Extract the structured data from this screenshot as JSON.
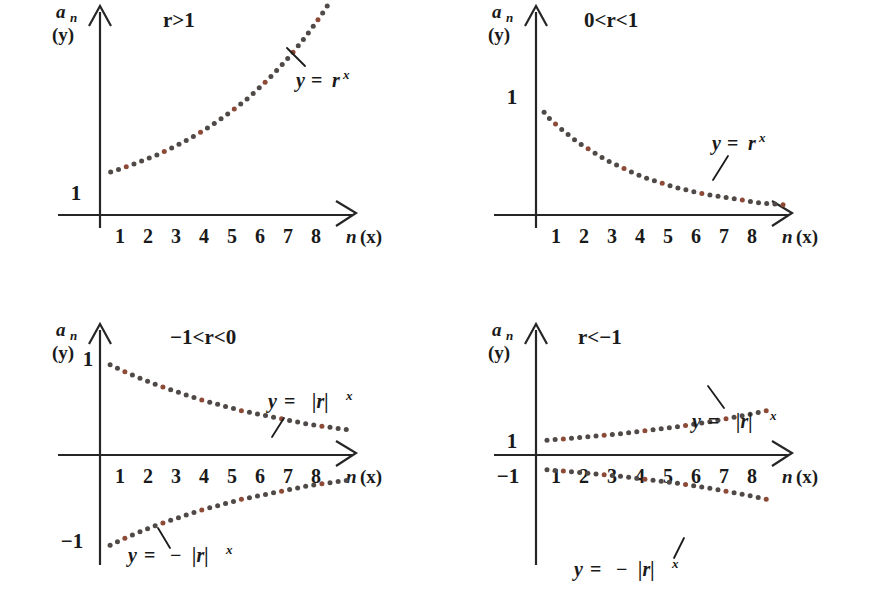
{
  "figure": {
    "background_color": "#ffffff",
    "axis_color": "#262626",
    "dot_color_dark": "#4f4a47",
    "dot_color_red": "#8d4a37"
  },
  "common": {
    "y_axis_label_main": "a",
    "y_axis_label_sub": "n",
    "y_axis_label_alt": "(y)",
    "x_axis_label_main": "n",
    "x_axis_label_alt": "(x)",
    "x_ticks": [
      "1",
      "2",
      "3",
      "4",
      "5",
      "6",
      "7",
      "8"
    ]
  },
  "panels": [
    {
      "id": "top-left",
      "title": "r>1",
      "y_ticks": [
        "1"
      ],
      "curves": [
        {
          "label_y": "y",
          "label_eq": "=",
          "label_base": "r",
          "label_exp": "x",
          "label_full": "y = rˣ",
          "label_plain": "y = r^x"
        }
      ]
    },
    {
      "id": "top-right",
      "title": "0<r<1",
      "y_ticks": [
        "1"
      ],
      "curves": [
        {
          "label_y": "y",
          "label_eq": "=",
          "label_base": "r",
          "label_exp": "x",
          "label_full": "y = rˣ",
          "label_plain": "y = r^x"
        }
      ]
    },
    {
      "id": "bottom-left",
      "title": "−1<r<0",
      "y_ticks": [
        "1",
        "−1"
      ],
      "curves": [
        {
          "label_y": "y",
          "label_eq": "=",
          "label_base": "|r|",
          "label_exp": "x",
          "label_plain": "y = |r|^x"
        },
        {
          "label_y": "y",
          "label_eq": "=",
          "label_minus": "−",
          "label_base": "|r|",
          "label_exp": "x",
          "label_plain": "y = -|r|^x"
        }
      ]
    },
    {
      "id": "bottom-right",
      "title": "r<−1",
      "y_ticks": [
        "1",
        "−1"
      ],
      "curves": [
        {
          "label_y": "y",
          "label_eq": "=",
          "label_base": "|r|",
          "label_exp": "x",
          "label_plain": "y = |r|^x"
        },
        {
          "label_y": "y",
          "label_eq": "=",
          "label_minus": "−",
          "label_base": "|r|",
          "label_exp": "x",
          "label_plain": "y = -|r|^x"
        }
      ]
    }
  ],
  "chart_data": {
    "type": "scatter",
    "xlabel": "n (x)",
    "ylabel": "a_n (y)",
    "grid": false,
    "legend": "inline-annotations",
    "charts": [
      {
        "panel": "top-left",
        "condition": "r>1",
        "xlim": [
          0,
          9.2
        ],
        "ylim": [
          0,
          5.2
        ],
        "x_ticks": [
          1,
          2,
          3,
          4,
          5,
          6,
          7,
          8
        ],
        "y_ticks": [
          1
        ],
        "series": [
          {
            "name": "y = r^x",
            "formula": "y = r^x, r = 1.22",
            "x": [
              0.1,
              0.4,
              0.8,
              1.2,
              1.6,
              2.0,
              2.4,
              2.8,
              3.2,
              3.6,
              4.0,
              4.4,
              4.8,
              5.2,
              5.6,
              6.0,
              6.4,
              6.8,
              7.2,
              7.6,
              8.0,
              8.3
            ],
            "y": [
              1.02,
              1.08,
              1.17,
              1.27,
              1.38,
              1.49,
              1.62,
              1.76,
              1.91,
              2.07,
              2.25,
              2.44,
              2.65,
              2.87,
              3.12,
              3.39,
              3.68,
              3.99,
              4.33,
              4.7,
              5.1,
              5.42
            ]
          }
        ]
      },
      {
        "panel": "top-right",
        "condition": "0<r<1",
        "xlim": [
          0,
          9.2
        ],
        "ylim": [
          0,
          1.4
        ],
        "x_ticks": [
          1,
          2,
          3,
          4,
          5,
          6,
          7,
          8
        ],
        "y_ticks": [
          1
        ],
        "series": [
          {
            "name": "y = r^x",
            "formula": "y = r^x, r = 0.76",
            "x": [
              0.1,
              0.5,
              1.0,
              1.5,
              2.0,
              2.5,
              3.0,
              3.5,
              4.0,
              4.5,
              5.0,
              5.5,
              6.0,
              6.5,
              7.0,
              7.5,
              8.0,
              8.5,
              9.0
            ],
            "y": [
              0.99,
              0.87,
              0.76,
              0.66,
              0.58,
              0.5,
              0.44,
              0.38,
              0.33,
              0.29,
              0.25,
              0.22,
              0.19,
              0.17,
              0.15,
              0.13,
              0.11,
              0.1,
              0.09
            ]
          }
        ]
      },
      {
        "panel": "bottom-left",
        "condition": "-1<r<0",
        "xlim": [
          0,
          9.2
        ],
        "ylim": [
          -1.3,
          1.3
        ],
        "x_ticks": [
          1,
          2,
          3,
          4,
          5,
          6,
          7,
          8
        ],
        "y_ticks": [
          1,
          -1
        ],
        "series": [
          {
            "name": "y = |r|^x",
            "formula": "y = |r|^x, |r| = 0.86",
            "x": [
              0.1,
              0.5,
              1.0,
              1.5,
              2.0,
              2.5,
              3.0,
              3.5,
              4.0,
              4.5,
              5.0,
              5.5,
              6.0,
              6.5,
              7.0,
              7.5,
              8.0,
              8.5,
              9.0
            ],
            "y": [
              0.99,
              0.93,
              0.86,
              0.8,
              0.74,
              0.69,
              0.64,
              0.59,
              0.55,
              0.51,
              0.47,
              0.44,
              0.41,
              0.38,
              0.35,
              0.32,
              0.3,
              0.28,
              0.26
            ]
          },
          {
            "name": "y = -|r|^x",
            "formula": "y = -|r|^x, |r| = 0.86",
            "x": [
              0.1,
              0.5,
              1.0,
              1.5,
              2.0,
              2.5,
              3.0,
              3.5,
              4.0,
              4.5,
              5.0,
              5.5,
              6.0,
              6.5,
              7.0,
              7.5,
              8.0,
              8.5,
              9.0
            ],
            "y": [
              -0.99,
              -0.93,
              -0.86,
              -0.8,
              -0.74,
              -0.69,
              -0.64,
              -0.59,
              -0.55,
              -0.51,
              -0.47,
              -0.44,
              -0.41,
              -0.38,
              -0.35,
              -0.32,
              -0.3,
              -0.28,
              -0.26
            ]
          }
        ]
      },
      {
        "panel": "bottom-right",
        "condition": "r<-1",
        "xlim": [
          0,
          9.2
        ],
        "ylim": [
          -3.2,
          3.2
        ],
        "x_ticks": [
          1,
          2,
          3,
          4,
          5,
          6,
          7,
          8
        ],
        "y_ticks": [
          1,
          -1
        ],
        "series": [
          {
            "name": "y = |r|^x",
            "formula": "y = |r|^x, |r| = 1.15",
            "x": [
              0.1,
              0.5,
              1.0,
              1.5,
              2.0,
              2.5,
              3.0,
              3.5,
              4.0,
              4.5,
              5.0,
              5.5,
              6.0,
              6.5,
              7.0,
              7.5,
              8.0,
              8.5
            ],
            "y": [
              1.01,
              1.07,
              1.15,
              1.24,
              1.32,
              1.42,
              1.52,
              1.63,
              1.75,
              1.88,
              2.01,
              2.16,
              2.31,
              2.48,
              2.66,
              2.86,
              3.06,
              3.29
            ]
          },
          {
            "name": "y = -|r|^x",
            "formula": "y = -|r|^x, |r| = 1.15",
            "x": [
              0.1,
              0.5,
              1.0,
              1.5,
              2.0,
              2.5,
              3.0,
              3.5,
              4.0,
              4.5,
              5.0,
              5.5,
              6.0,
              6.5,
              7.0,
              7.5,
              8.0,
              8.5
            ],
            "y": [
              -1.01,
              -1.07,
              -1.15,
              -1.24,
              -1.32,
              -1.42,
              -1.52,
              -1.63,
              -1.75,
              -1.88,
              -2.01,
              -2.16,
              -2.31,
              -2.48,
              -2.66,
              -2.86,
              -3.06,
              -3.29
            ]
          }
        ]
      }
    ]
  }
}
